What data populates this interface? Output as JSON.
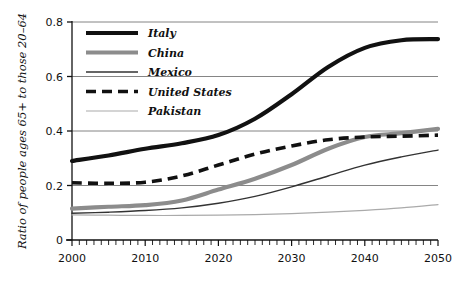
{
  "chart_data": {
    "type": "line",
    "title": "",
    "xlabel": "",
    "ylabel": "Ratio of people ages 65+ to those 20–64",
    "xlim": [
      2000,
      2050
    ],
    "ylim": [
      0,
      0.8
    ],
    "xticks": [
      2000,
      2010,
      2020,
      2030,
      2040,
      2050
    ],
    "xtick_labels": [
      "2000",
      "2010",
      "2020",
      "2030",
      "2040",
      "2050"
    ],
    "yticks": [
      0,
      0.2,
      0.4,
      0.6,
      0.8
    ],
    "ytick_labels": [
      "0",
      "0.2",
      "0.4",
      "0.6",
      "0.8"
    ],
    "grid": "horizontal",
    "minor_xtick_interval": 1,
    "legend_position": "top-left",
    "x": [
      2000,
      2005,
      2010,
      2015,
      2020,
      2025,
      2030,
      2035,
      2040,
      2045,
      2050
    ],
    "series": [
      {
        "name": "Italy",
        "style": "solid",
        "color": "#111111",
        "width": 4.2,
        "values": [
          0.29,
          0.31,
          0.335,
          0.355,
          0.385,
          0.445,
          0.535,
          0.635,
          0.705,
          0.733,
          0.737
        ]
      },
      {
        "name": "China",
        "style": "solid",
        "color": "#8c8c8c",
        "width": 4.2,
        "values": [
          0.115,
          0.122,
          0.128,
          0.145,
          0.185,
          0.225,
          0.275,
          0.335,
          0.378,
          0.392,
          0.408
        ]
      },
      {
        "name": "Mexico",
        "style": "solid",
        "color": "#333333",
        "width": 1.4,
        "values": [
          0.098,
          0.102,
          0.108,
          0.118,
          0.135,
          0.16,
          0.195,
          0.235,
          0.275,
          0.305,
          0.33
        ]
      },
      {
        "name": "United States",
        "style": "dashed",
        "color": "#111111",
        "width": 3.6,
        "values": [
          0.21,
          0.208,
          0.212,
          0.235,
          0.275,
          0.315,
          0.345,
          0.368,
          0.378,
          0.381,
          0.385
        ]
      },
      {
        "name": "Pakistan",
        "style": "solid",
        "color": "#aaaaaa",
        "width": 1.2,
        "values": [
          0.092,
          0.091,
          0.09,
          0.09,
          0.091,
          0.093,
          0.097,
          0.102,
          0.109,
          0.118,
          0.13
        ]
      }
    ]
  }
}
